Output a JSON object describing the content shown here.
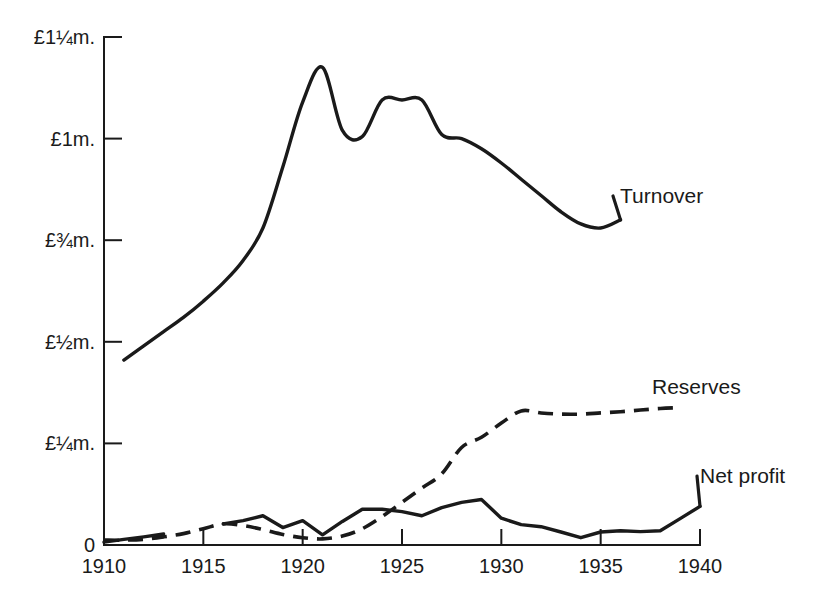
{
  "chart_data": {
    "type": "line",
    "title": "",
    "subtitle": "",
    "xlabel": "",
    "ylabel": "",
    "xlim": [
      1910,
      1940
    ],
    "ylim": [
      0,
      1.25
    ],
    "grid": false,
    "legend_position": "right-inline-labels",
    "y_tick_labels": [
      "0",
      "£¼m.",
      "£½m.",
      "£¾m.",
      "£1m.",
      "£1¼m."
    ],
    "y_tick_values": [
      0,
      0.25,
      0.5,
      0.75,
      1.0,
      1.25
    ],
    "x_tick_labels": [
      "1910",
      "1915",
      "1920",
      "1925",
      "1930",
      "1935",
      "1940"
    ],
    "x_tick_values": [
      1910,
      1915,
      1920,
      1925,
      1930,
      1935,
      1940
    ],
    "units": "pounds sterling (millions)",
    "series": [
      {
        "name": "Turnover",
        "style": "solid",
        "label": "Turnover",
        "x": [
          1911,
          1912,
          1913,
          1914,
          1915,
          1916,
          1917,
          1918,
          1919,
          1920,
          1921,
          1922,
          1923,
          1924,
          1925,
          1926,
          1927,
          1928,
          1929,
          1930,
          1931,
          1932,
          1933,
          1934,
          1935,
          1936
        ],
        "values": [
          0.455,
          0.49,
          0.525,
          0.56,
          0.6,
          0.645,
          0.7,
          0.78,
          0.93,
          1.09,
          1.175,
          1.02,
          1.005,
          1.095,
          1.095,
          1.095,
          1.01,
          1.0,
          0.975,
          0.94,
          0.9,
          0.86,
          0.82,
          0.79,
          0.78,
          0.8
        ]
      },
      {
        "name": "Reserves",
        "style": "dashed",
        "label": "Reserves",
        "x": [
          1910,
          1911,
          1912,
          1913,
          1914,
          1915,
          1916,
          1917,
          1918,
          1919,
          1920,
          1921,
          1922,
          1923,
          1924,
          1925,
          1926,
          1927,
          1928,
          1929,
          1930,
          1931,
          1932,
          1933,
          1934,
          1935,
          1936,
          1937,
          1938,
          1939
        ],
        "values": [
          0.012,
          0.012,
          0.014,
          0.02,
          0.028,
          0.04,
          0.052,
          0.048,
          0.038,
          0.026,
          0.018,
          0.015,
          0.022,
          0.04,
          0.07,
          0.105,
          0.14,
          0.175,
          0.24,
          0.265,
          0.3,
          0.33,
          0.325,
          0.322,
          0.322,
          0.325,
          0.328,
          0.332,
          0.336,
          0.338
        ]
      },
      {
        "name": "Net profit (early segment)",
        "style": "solid",
        "label": "",
        "x": [
          1910,
          1911,
          1912,
          1913
        ],
        "values": [
          0.007,
          0.014,
          0.02,
          0.027
        ]
      },
      {
        "name": "Net profit",
        "style": "solid",
        "label": "Net profit",
        "x": [
          1916,
          1917,
          1918,
          1919,
          1920,
          1921,
          1922,
          1923,
          1924,
          1925,
          1926,
          1927,
          1928,
          1929,
          1930,
          1931,
          1932,
          1933,
          1934,
          1935,
          1936,
          1937,
          1938,
          1939,
          1940
        ],
        "values": [
          0.052,
          0.06,
          0.072,
          0.043,
          0.06,
          0.025,
          0.058,
          0.088,
          0.088,
          0.082,
          0.072,
          0.092,
          0.105,
          0.112,
          0.066,
          0.05,
          0.045,
          0.032,
          0.018,
          0.032,
          0.035,
          0.033,
          0.035,
          0.065,
          0.095
        ]
      }
    ]
  },
  "labels": {
    "turnover": "Turnover",
    "reserves": "Reserves",
    "net_profit": "Net profit"
  },
  "colors": {
    "ink": "#1a1a1a",
    "background": "#ffffff"
  }
}
